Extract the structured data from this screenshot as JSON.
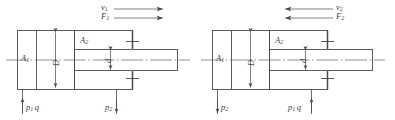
{
  "figure": {
    "type": "engineering-drawing",
    "line_color": "#4a4a4a",
    "label_color": "#3a3a3a",
    "background": "#ffffff"
  },
  "diagrams": [
    {
      "id": "left",
      "name": "cylinder-extend",
      "labels": {
        "velocity": "v",
        "velocity_sub": "1",
        "force": "F",
        "force_sub": "1",
        "area_cap": "A",
        "area_cap_sub": "1",
        "area_rod": "A",
        "area_rod_sub": "2",
        "bore": "D",
        "rod": "d",
        "pressure_in": "p",
        "pressure_in_sub": "1",
        "flow": "q",
        "pressure_out": "p",
        "pressure_out_sub": "2"
      },
      "arrows": {
        "motion_direction": "right",
        "inlet_direction": "up",
        "outlet_direction": "down"
      }
    },
    {
      "id": "right",
      "name": "cylinder-retract",
      "labels": {
        "velocity": "v",
        "velocity_sub": "2",
        "force": "F",
        "force_sub": "2",
        "area_cap": "A",
        "area_cap_sub": "1",
        "area_rod": "A",
        "area_rod_sub": "2",
        "bore": "D",
        "rod": "d",
        "pressure_out": "p",
        "pressure_out_sub": "2",
        "pressure_in": "p",
        "pressure_in_sub": "1",
        "flow": "q"
      },
      "arrows": {
        "motion_direction": "left",
        "inlet_direction": "up",
        "outlet_direction": "down"
      }
    }
  ]
}
